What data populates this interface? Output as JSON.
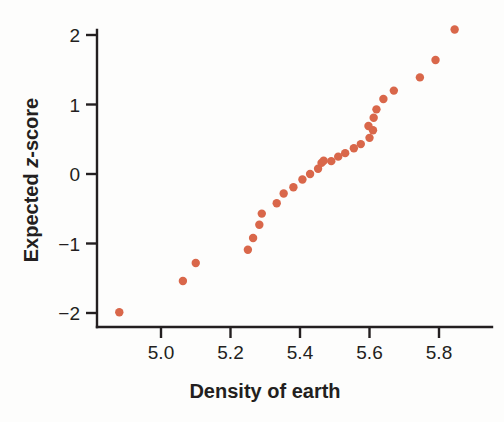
{
  "chart_data": {
    "type": "scatter",
    "title": "",
    "subtitle": "",
    "xlabel": "Density of earth",
    "ylabel_plain": "Expected z-score",
    "ylabel_parts": [
      "Expected ",
      "z",
      "-score"
    ],
    "xlim": [
      4.84,
      5.89
    ],
    "ylim": [
      -2.28,
      2.3
    ],
    "xticks": [
      5.0,
      5.2,
      5.4,
      5.6,
      5.8
    ],
    "xtick_labels": [
      "5.0",
      "5.2",
      "5.4",
      "5.6",
      "5.8"
    ],
    "yticks": [
      -2,
      -1,
      0,
      1,
      2
    ],
    "ytick_labels": [
      "−2",
      "−1",
      "0",
      "1",
      "2"
    ],
    "grid": false,
    "legend": null,
    "marker": {
      "shape": "circle",
      "color": "#d9674a",
      "radius_px": 4.2,
      "count": 29
    },
    "series": [
      {
        "name": "Normal Q-Q of earth density",
        "x": [
          4.88,
          5.063,
          5.1,
          5.25,
          5.265,
          5.283,
          5.29,
          5.333,
          5.353,
          5.381,
          5.407,
          5.429,
          5.452,
          5.462,
          5.468,
          5.51,
          5.53,
          5.555,
          5.575,
          5.6,
          5.61,
          5.62,
          5.64,
          5.67,
          5.745,
          5.79,
          5.845,
          5.345,
          5.49
        ],
        "y": [
          -1.99,
          -1.54,
          -1.28,
          -1.09,
          -0.92,
          -0.73,
          -0.57,
          -0.42,
          -0.28,
          -0.19,
          -0.08,
          0.0,
          0.075,
          0.19,
          0.16,
          0.25,
          0.3,
          0.37,
          0.43,
          0.52,
          0.63,
          0.8,
          1.08,
          1.2,
          1.39,
          1.64,
          2.08,
          -0.32,
          0.21
        ]
      }
    ],
    "points": [
      {
        "x": 4.88,
        "y": -1.99
      },
      {
        "x": 5.063,
        "y": -1.54
      },
      {
        "x": 5.1,
        "y": -1.28
      },
      {
        "x": 5.25,
        "y": -1.09
      },
      {
        "x": 5.265,
        "y": -0.92
      },
      {
        "x": 5.283,
        "y": -0.73
      },
      {
        "x": 5.29,
        "y": -0.57
      },
      {
        "x": 5.333,
        "y": -0.42
      },
      {
        "x": 5.353,
        "y": -0.28
      },
      {
        "x": 5.381,
        "y": -0.19
      },
      {
        "x": 5.407,
        "y": -0.08
      },
      {
        "x": 5.429,
        "y": 0.0
      },
      {
        "x": 5.452,
        "y": 0.075
      },
      {
        "x": 5.462,
        "y": 0.16
      },
      {
        "x": 5.468,
        "y": 0.19
      },
      {
        "x": 5.49,
        "y": 0.185
      },
      {
        "x": 5.51,
        "y": 0.25
      },
      {
        "x": 5.53,
        "y": 0.3
      },
      {
        "x": 5.555,
        "y": 0.37
      },
      {
        "x": 5.575,
        "y": 0.43
      },
      {
        "x": 5.6,
        "y": 0.52
      },
      {
        "x": 5.61,
        "y": 0.63
      },
      {
        "x": 5.597,
        "y": 0.69
      },
      {
        "x": 5.612,
        "y": 0.81
      },
      {
        "x": 5.62,
        "y": 0.93
      },
      {
        "x": 5.64,
        "y": 1.08
      },
      {
        "x": 5.67,
        "y": 1.2
      },
      {
        "x": 5.745,
        "y": 1.39
      },
      {
        "x": 5.79,
        "y": 1.64
      },
      {
        "x": 5.845,
        "y": 2.08
      }
    ]
  },
  "colors": {
    "marker": "#d9674a",
    "axis": "#231f20",
    "text": "#231f20",
    "background": "#fdfdfc"
  }
}
